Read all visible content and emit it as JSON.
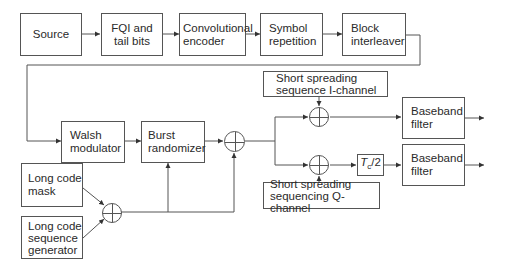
{
  "diagram": {
    "title": "",
    "blocks": {
      "source": "Source",
      "fqi": "FQI and tail bits",
      "conv": "Convolutional encoder",
      "symrep": "Symbol repetition",
      "interleaver": "Block interleaver",
      "walsh": "Walsh modulator",
      "burst": "Burst randomizer",
      "lcmask": "Long code mask",
      "lcgen": "Long code sequence generator",
      "ss_i": "Short spreading sequence I-channel",
      "ss_q": "Short spreading sequencing Q-channel",
      "delay_symbol": "T",
      "delay_sub": "c",
      "delay_rest": "/2",
      "bb1": "Baseband filter",
      "bb2": "Baseband filter"
    },
    "lines": {
      "fqi_1": "FQI and",
      "fqi_2": "tail bits",
      "conv_1": "Convolutional",
      "conv_2": "encoder",
      "symrep_1": "Symbol",
      "symrep_2": "repetition",
      "inter_1": "Block",
      "inter_2": "interleaver",
      "walsh_1": "Walsh",
      "walsh_2": "modulator",
      "burst_1": "Burst",
      "burst_2": "randomizer",
      "lcmask_1": "Long code",
      "lcmask_2": "mask",
      "lcgen_1": "Long code",
      "lcgen_2": "sequence",
      "lcgen_3": "generator",
      "ssi_1": "Short spreading",
      "ssi_2": "sequence I-channel",
      "ssq_1": "Short spreading",
      "ssq_2": "sequencing Q-channel",
      "bb1_1": "Baseband",
      "bb1_2": "filter",
      "bb2_1": "Baseband",
      "bb2_2": "filter"
    },
    "operators": {
      "xor_symbol": "modulo-2 adder (⊕)"
    },
    "colors": {
      "line": "#555555",
      "text": "#2a2a2a",
      "background": "#ffffff"
    }
  }
}
